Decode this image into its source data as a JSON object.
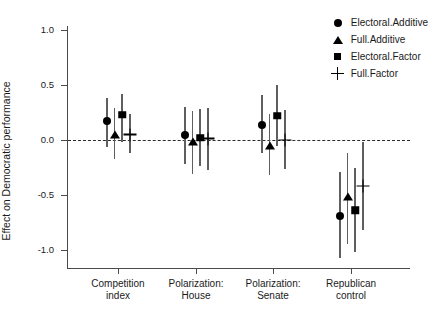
{
  "chart_data": {
    "type": "scatter",
    "title": "",
    "xlabel": "",
    "ylabel": "Effect on Democratic performance",
    "ylim": [
      -1.25,
      1.15
    ],
    "yticks": [
      1.0,
      0.5,
      0.0,
      -0.5,
      -1.0
    ],
    "ytick_labels": [
      "1.0",
      "0.5",
      "0.0",
      "-0.5",
      "-1.0"
    ],
    "grid": false,
    "zero_reference_line": 0.0,
    "legend_position": "top-right",
    "categories": [
      "Competition index",
      "Polarization: House",
      "Polarization: Senate",
      "Republican control"
    ],
    "category_lines": [
      [
        "Competition",
        "index"
      ],
      [
        "Polarization:",
        "House"
      ],
      [
        "Polarization:",
        "Senate"
      ],
      [
        "Republican",
        "control"
      ]
    ],
    "series": [
      {
        "name": "Electoral.Additive",
        "marker": "circle",
        "values": [
          0.17,
          0.05,
          0.14,
          -0.69
        ],
        "ci_low": [
          -0.06,
          -0.22,
          -0.12,
          -1.07
        ],
        "ci_high": [
          0.38,
          0.3,
          0.41,
          -0.29
        ]
      },
      {
        "name": "Full.Additive",
        "marker": "triangle",
        "values": [
          0.05,
          -0.02,
          -0.05,
          -0.52
        ],
        "ci_low": [
          -0.17,
          -0.31,
          -0.32,
          -0.95
        ],
        "ci_high": [
          0.29,
          0.26,
          0.24,
          -0.12
        ]
      },
      {
        "name": "Electoral.Factor",
        "marker": "square",
        "values": [
          0.23,
          0.02,
          0.22,
          -0.64
        ],
        "ci_low": [
          -0.02,
          -0.24,
          -0.05,
          -1.02
        ],
        "ci_high": [
          0.42,
          0.28,
          0.5,
          -0.25
        ]
      },
      {
        "name": "Full.Factor",
        "marker": "plus",
        "values": [
          0.05,
          0.01,
          0.0,
          -0.42
        ],
        "ci_low": [
          -0.12,
          -0.27,
          -0.26,
          -0.82
        ],
        "ci_high": [
          0.24,
          0.29,
          0.27,
          -0.02
        ]
      }
    ]
  },
  "legend": {
    "items": [
      {
        "label": "Electoral.Additive",
        "marker": "circle"
      },
      {
        "label": "Full.Additive",
        "marker": "triangle"
      },
      {
        "label": "Electoral.Factor",
        "marker": "square"
      },
      {
        "label": "Full.Factor",
        "marker": "plus"
      }
    ]
  }
}
